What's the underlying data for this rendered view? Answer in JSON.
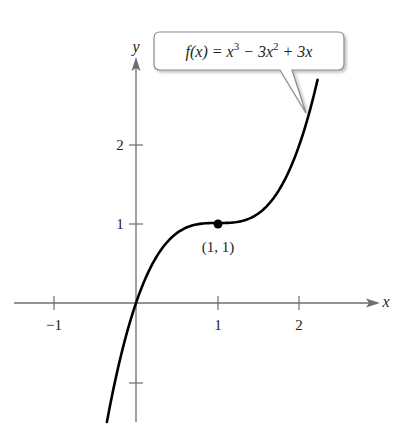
{
  "chart_data": {
    "type": "line",
    "title": "",
    "function_label": "f(x) = x^3 − 3x^2 + 3x",
    "callout": {
      "prefix": "f(x) = x",
      "exp1": "3",
      "mid": " − 3x",
      "exp2": "2",
      "suffix": " + 3x"
    },
    "xlabel": "x",
    "ylabel": "y",
    "xlim": [
      -1.65,
      2.9
    ],
    "ylim": [
      -1.49,
      2.95
    ],
    "x_ticks": [
      -1,
      1,
      2
    ],
    "x_tick_labels": [
      "−1",
      "1",
      "2"
    ],
    "y_ticks": [
      2,
      1,
      -1
    ],
    "y_tick_labels": [
      "2",
      "1",
      ""
    ],
    "grid": false,
    "series": [
      {
        "name": "f(x) = x^3 − 3x^2 + 3x",
        "x_range": [
          -0.355,
          2.214
        ],
        "points": [
          [
            -0.355,
            -1.49
          ],
          [
            0,
            0
          ],
          [
            0.5,
            0.875
          ],
          [
            1,
            1
          ],
          [
            1.5,
            1.125
          ],
          [
            2,
            2
          ],
          [
            2.214,
            2.79
          ]
        ]
      }
    ],
    "annotations": [
      {
        "text": "(1, 1)",
        "x": 1,
        "y": 1
      }
    ]
  },
  "labels": {
    "x_axis": "x",
    "y_axis": "y",
    "point": "(1, 1)",
    "x_neg1": "−1",
    "x_1": "1",
    "x_2": "2",
    "y_1": "1",
    "y_2": "2"
  },
  "colors": {
    "axis": "#6d6e71",
    "curve": "#000000",
    "callout_border": "#8a8a8a",
    "text": "#231f20"
  }
}
